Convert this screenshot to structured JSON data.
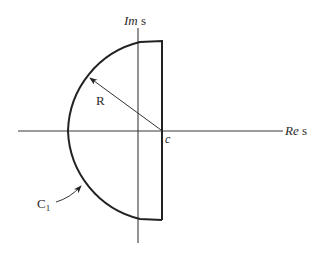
{
  "diagram": {
    "axes": {
      "imaginary_label_italic": "Im",
      "imaginary_label_rest": " s",
      "real_label_italic": "Re",
      "real_label_rest": " s"
    },
    "labels": {
      "radius": "R",
      "point_c": "c",
      "contour_main": "C",
      "contour_sub": "1"
    },
    "colors": {
      "line": "#222222",
      "background": "#ffffff"
    }
  }
}
